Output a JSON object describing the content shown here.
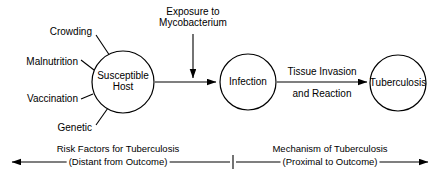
{
  "figure": {
    "type": "flow-diagram",
    "background_color": "#ffffff",
    "line_color": "#000000"
  },
  "nodes": [
    {
      "id": "susceptible-host",
      "label_line1": "Susceptible",
      "label_line2": "Host",
      "cx": 123,
      "cy": 82,
      "r": 31
    },
    {
      "id": "infection",
      "label_line1": "Infection",
      "label_line2": "",
      "cx": 248,
      "cy": 82,
      "r": 28
    },
    {
      "id": "tuberculosis",
      "label_line1": "Tuberculosis",
      "label_line2": "",
      "cx": 398,
      "cy": 83,
      "r": 28
    }
  ],
  "risk_factors": [
    {
      "label": "Crowding",
      "x": 92,
      "y": 32
    },
    {
      "label": "Malnutrition",
      "x": 78,
      "y": 62
    },
    {
      "label": "Vaccination",
      "x": 78,
      "y": 99
    },
    {
      "label": "Genetic",
      "x": 92,
      "y": 128
    }
  ],
  "edge_labels": [
    {
      "id": "exposure",
      "line1": "Exposure to",
      "line2": "Mycobacterium",
      "x": 193,
      "y": 18
    },
    {
      "id": "tissue-invasion",
      "line1": "Tissue Invasion",
      "line2": "and Reaction",
      "x": 322,
      "y": 82
    }
  ],
  "captions": [
    {
      "id": "risk-factors-caption",
      "line1": "Risk Factors for Tuberculosis",
      "line2": "(Distant from Outcome)",
      "x": 118,
      "y_line1": 149,
      "y_line2": 162
    },
    {
      "id": "mechanism-caption",
      "line1": "Mechanism of Tuberculosis",
      "line2": "(Proximal to Outcome)",
      "x": 330,
      "y_line1": 149,
      "y_line2": 162
    }
  ]
}
